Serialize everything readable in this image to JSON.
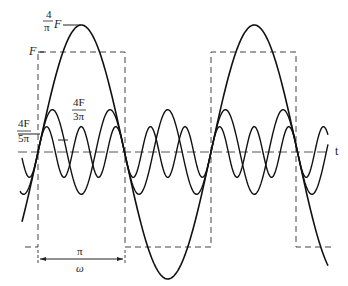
{
  "diagram": {
    "labels": {
      "fundamental_amp_num": "4",
      "fundamental_amp_den": "π",
      "fundamental_amp_F": "F",
      "square_amp": "F",
      "third_amp_num": "4F",
      "third_amp_den": "3π",
      "fifth_amp_num": "4F",
      "fifth_amp_den": "5π",
      "axis": "t",
      "half_period_num": "π",
      "half_period_den": "ω"
    },
    "colors": {
      "stroke": "#222222",
      "background": "#ffffff"
    }
  }
}
